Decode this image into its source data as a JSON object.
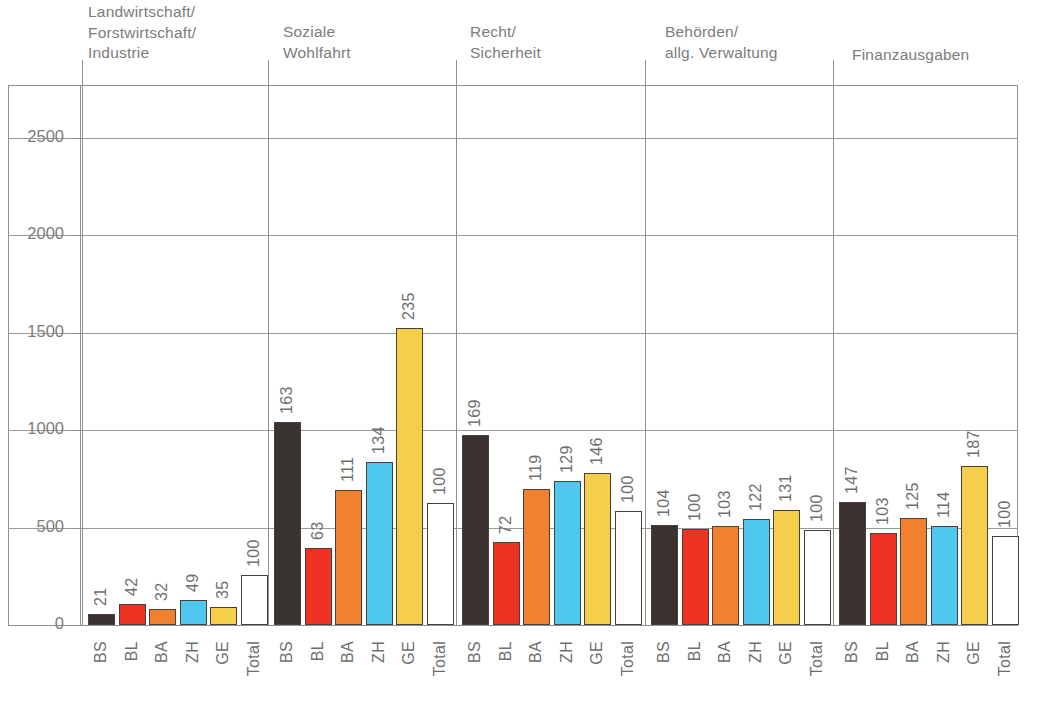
{
  "chart_data": {
    "type": "bar",
    "title": "",
    "subtitle": "",
    "xlabel": "",
    "ylabel": "",
    "ylim": [
      0,
      2750
    ],
    "yticks": [
      0,
      500,
      1000,
      1500,
      2000,
      2500
    ],
    "ytick_labels": [
      "0",
      "500",
      "1000",
      "1500",
      "2000",
      "2500"
    ],
    "grid": true,
    "legend": "none",
    "categories": [
      "BS",
      "BL",
      "BA",
      "ZH",
      "GE",
      "Total"
    ],
    "group_labels": [
      "Landwirtschaft/\nForstwirtschaft/\nIndustrie",
      "Soziale\nWohlfahrt",
      "Recht/\nSicherheit",
      "Behörden/\nallg. Verwaltung",
      "Finanzausgaben"
    ],
    "groups": [
      {
        "name": "Landwirtschaft/ Forstwirtschaft/ Industrie",
        "bars": [
          {
            "category": "BS",
            "label": "21",
            "value": 21,
            "absolute": 55,
            "color": "#3a3230"
          },
          {
            "category": "BL",
            "label": "42",
            "value": 42,
            "absolute": 108,
            "color": "#f03223"
          },
          {
            "category": "BA",
            "label": "32",
            "value": 32,
            "absolute": 82,
            "color": "#f2812f"
          },
          {
            "category": "ZH",
            "label": "49",
            "value": 49,
            "absolute": 126,
            "color": "#4ec8ef"
          },
          {
            "category": "GE",
            "label": "35",
            "value": 35,
            "absolute": 90,
            "color": "#f5cf4b"
          },
          {
            "category": "Total",
            "label": "100",
            "value": 100,
            "absolute": 255,
            "color": "#ffffff"
          }
        ]
      },
      {
        "name": "Soziale Wohlfahrt",
        "bars": [
          {
            "category": "BS",
            "label": "163",
            "value": 163,
            "absolute": 1040,
            "color": "#3a3230"
          },
          {
            "category": "BL",
            "label": "63",
            "value": 63,
            "absolute": 394,
            "color": "#f03223"
          },
          {
            "category": "BA",
            "label": "111",
            "value": 111,
            "absolute": 694,
            "color": "#f2812f"
          },
          {
            "category": "ZH",
            "label": "134",
            "value": 134,
            "absolute": 838,
            "color": "#4ec8ef"
          },
          {
            "category": "GE",
            "label": "235",
            "value": 235,
            "absolute": 1525,
            "color": "#f5cf4b"
          },
          {
            "category": "Total",
            "label": "100",
            "value": 100,
            "absolute": 625,
            "color": "#ffffff"
          }
        ]
      },
      {
        "name": "Recht/ Sicherheit",
        "bars": [
          {
            "category": "BS",
            "label": "169",
            "value": 169,
            "absolute": 975,
            "color": "#3a3230"
          },
          {
            "category": "BL",
            "label": "72",
            "value": 72,
            "absolute": 425,
            "color": "#f03223"
          },
          {
            "category": "BA",
            "label": "119",
            "value": 119,
            "absolute": 700,
            "color": "#f2812f"
          },
          {
            "category": "ZH",
            "label": "129",
            "value": 129,
            "absolute": 740,
            "color": "#4ec8ef"
          },
          {
            "category": "GE",
            "label": "146",
            "value": 146,
            "absolute": 780,
            "color": "#f5cf4b"
          },
          {
            "category": "Total",
            "label": "100",
            "value": 100,
            "absolute": 585,
            "color": "#ffffff"
          }
        ]
      },
      {
        "name": "Behörden/ allg. Verwaltung",
        "bars": [
          {
            "category": "BS",
            "label": "104",
            "value": 104,
            "absolute": 512,
            "color": "#3a3230"
          },
          {
            "category": "BL",
            "label": "100",
            "value": 100,
            "absolute": 492,
            "color": "#f03223"
          },
          {
            "category": "BA",
            "label": "103",
            "value": 103,
            "absolute": 508,
            "color": "#f2812f"
          },
          {
            "category": "ZH",
            "label": "122",
            "value": 122,
            "absolute": 545,
            "color": "#4ec8ef"
          },
          {
            "category": "GE",
            "label": "131",
            "value": 131,
            "absolute": 588,
            "color": "#f5cf4b"
          },
          {
            "category": "Total",
            "label": "100",
            "value": 100,
            "absolute": 490,
            "color": "#ffffff"
          }
        ]
      },
      {
        "name": "Finanzausgaben",
        "bars": [
          {
            "category": "BS",
            "label": "147",
            "value": 147,
            "absolute": 630,
            "color": "#3a3230"
          },
          {
            "category": "BL",
            "label": "103",
            "value": 103,
            "absolute": 472,
            "color": "#f03223"
          },
          {
            "category": "BA",
            "label": "125",
            "value": 125,
            "absolute": 548,
            "color": "#f2812f"
          },
          {
            "category": "ZH",
            "label": "114",
            "value": 114,
            "absolute": 510,
            "color": "#4ec8ef"
          },
          {
            "category": "GE",
            "label": "187",
            "value": 187,
            "absolute": 818,
            "color": "#f5cf4b"
          },
          {
            "category": "Total",
            "label": "100",
            "value": 100,
            "absolute": 455,
            "color": "#ffffff"
          }
        ]
      }
    ],
    "colors": {
      "BS": "#3a3230",
      "BL": "#f03223",
      "BA": "#f2812f",
      "ZH": "#4ec8ef",
      "GE": "#f5cf4b",
      "Total": "#ffffff",
      "axis": "#8f8f8f",
      "text": "#6f6f6f",
      "outline": "#4a4038"
    }
  }
}
